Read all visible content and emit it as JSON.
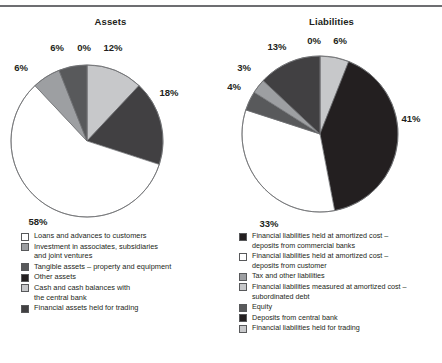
{
  "figure": {
    "cut_title": "",
    "rule_color": "#6d6e71"
  },
  "palette": {
    "white": "#ffffff",
    "light_gray": "#c7c8ca",
    "mid_gray": "#9d9fa2",
    "dark_gray": "#58595b",
    "darker_gray": "#414042",
    "near_black": "#231f20",
    "outline": "#6d6e71",
    "text": "#231f20"
  },
  "charts": {
    "assets": {
      "title": "Assets",
      "legend": [
        {
          "label": "Loans and advances to customers",
          "color": "#ffffff"
        },
        {
          "label": "Investment in associates, subsidiaries\nand joint ventures",
          "color": "#9d9fa2"
        },
        {
          "label": "Tangible assets – property and equipment",
          "color": "#58595b"
        },
        {
          "label": "Other assets",
          "color": "#231f20"
        },
        {
          "label": "Cash and cash balances with\nthe central bank",
          "color": "#c7c8ca"
        },
        {
          "label": "Financial assets held for trading",
          "color": "#414042"
        }
      ]
    },
    "liabilities": {
      "title": "Liabilities",
      "legend": [
        {
          "label": "Financial liabilities held at amortized cost –\ndeposits from commercial banks",
          "color": "#231f20"
        },
        {
          "label": "Financial liabilities held at amortized cost –\ndeposits from customer",
          "color": "#ffffff"
        },
        {
          "label": "Tax and other liabilities",
          "color": "#9d9fa2"
        },
        {
          "label": "Financial liabilities measured at amortized cost –\nsubordinated debt",
          "color": "#c7c8ca"
        },
        {
          "label": "Equity",
          "color": "#58595b"
        },
        {
          "label": "Deposits from central bank",
          "color": "#231f20"
        },
        {
          "label": "Financial liabilities held for trading",
          "color": "#c7c8ca"
        }
      ]
    }
  },
  "chart_data": [
    {
      "type": "pie",
      "title": "Assets",
      "id": "assets",
      "center": [
        87,
        112
      ],
      "radius": 76,
      "start_angle": 0,
      "direction": "clockwise",
      "labels_suffix": "%",
      "categories": [
        "Cash and cash balances with the central bank",
        "Tangible assets – property and equipment",
        "Loans and advances to customers",
        "Investment in associates, subsidiaries and joint ventures",
        "Financial assets held for trading",
        "Other assets"
      ],
      "values": [
        12,
        18,
        58,
        6,
        6,
        0
      ],
      "value_labels": [
        "12%",
        "18%",
        "58%",
        "6%",
        "6%",
        "0%"
      ],
      "colors": [
        "#c7c8ca",
        "#414042",
        "#ffffff",
        "#9d9fa2",
        "#58595b",
        "#231f20"
      ],
      "label_positions": [
        [
          113,
          22
        ],
        [
          169,
          67
        ],
        [
          38,
          196
        ],
        [
          21,
          42
        ],
        [
          57,
          22
        ],
        [
          84,
          22
        ]
      ],
      "label_anchors": [
        "middle",
        "middle",
        "middle",
        "middle",
        "middle",
        "middle"
      ]
    },
    {
      "type": "pie",
      "title": "Liabilities",
      "id": "liabilities",
      "center": [
        99,
        105
      ],
      "radius": 78,
      "start_angle": 0,
      "direction": "clockwise",
      "labels_suffix": "%",
      "categories": [
        "Financial liabilities measured at amortized cost – subordinated debt",
        "Financial liabilities held at amortized cost – deposits from commercial banks",
        "Financial liabilities held at amortized cost – deposits from customer",
        "Equity",
        "Tax and other liabilities",
        "Financial liabilities held for trading",
        "Deposits from central bank"
      ],
      "values": [
        6,
        41,
        33,
        4,
        3,
        13,
        0
      ],
      "value_labels": [
        "6%",
        "41%",
        "33%",
        "4%",
        "3%",
        "13%",
        "0%"
      ],
      "colors": [
        "#c7c8ca",
        "#231f20",
        "#ffffff",
        "#58595b",
        "#9d9fa2",
        "#414042",
        "#231f20"
      ],
      "label_positions": [
        [
          119,
          15
        ],
        [
          190,
          93
        ],
        [
          48,
          198
        ],
        [
          13,
          61
        ],
        [
          23,
          42
        ],
        [
          56,
          21
        ],
        [
          93,
          15
        ]
      ],
      "label_anchors": [
        "middle",
        "middle",
        "middle",
        "middle",
        "middle",
        "middle",
        "middle"
      ]
    }
  ]
}
